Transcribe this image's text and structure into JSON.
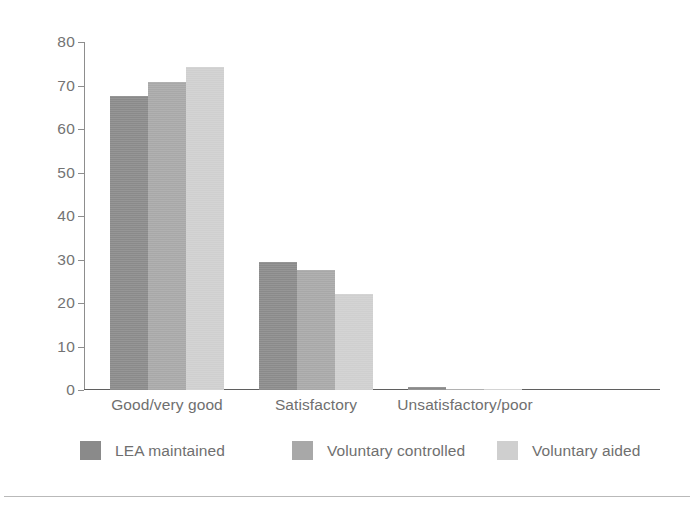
{
  "chart_data": {
    "type": "bar",
    "title": "",
    "subtitle": "",
    "xlabel": "",
    "ylabel": "",
    "categories": [
      "Good/very good",
      "Satisfactory",
      "Unsatisfactory/poor"
    ],
    "series": [
      {
        "name": "LEA maintained",
        "color": "#8a8a8a",
        "values": [
          67.6,
          29.5,
          0.7
        ]
      },
      {
        "name": "Voluntary controlled",
        "color": "#a8a8a8",
        "values": [
          70.8,
          27.7,
          0.2
        ]
      },
      {
        "name": "Voluntary aided",
        "color": "#cfcfcf",
        "values": [
          74.2,
          22.1,
          0.1
        ]
      }
    ],
    "ylim": [
      0,
      80
    ],
    "yticks": [
      0,
      10,
      20,
      30,
      40,
      50,
      60,
      70,
      80
    ],
    "ytick_labels": [
      "0",
      "10",
      "20",
      "30",
      "40",
      "50",
      "60",
      "70",
      "80"
    ],
    "grid": false,
    "legend_position": "bottom",
    "bar_group_gap": true,
    "axis_color": "#8d8d8d"
  },
  "axis": {
    "y_ticks": [
      "80",
      "70",
      "60",
      "50",
      "40",
      "30",
      "20",
      "10",
      "0"
    ]
  },
  "legend": {
    "items": [
      {
        "label": "LEA maintained"
      },
      {
        "label": "Voluntary controlled"
      },
      {
        "label": "Voluntary aided"
      }
    ]
  },
  "artifact": {
    "top_text": ""
  }
}
